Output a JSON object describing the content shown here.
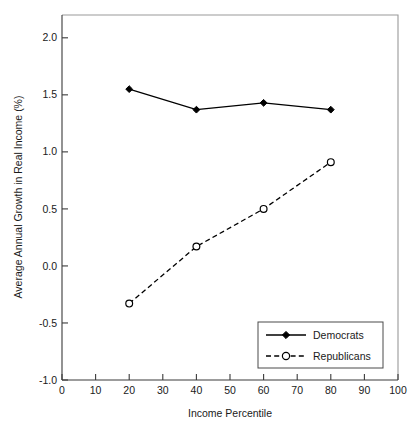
{
  "chart_data": {
    "type": "line",
    "title": "",
    "xlabel": "Income Percentile",
    "ylabel": "Average Annual Growth in Real Income (%)",
    "xlim": [
      0,
      100
    ],
    "ylim": [
      -1.0,
      2.2
    ],
    "grid": false,
    "legend_position": "lower right",
    "xticks": [
      0,
      10,
      20,
      30,
      40,
      50,
      60,
      70,
      80,
      90,
      100
    ],
    "xtick_labels": [
      "0",
      "10",
      "20",
      "30",
      "40",
      "50",
      "60",
      "70",
      "80",
      "90",
      "100"
    ],
    "yticks": [
      -1.0,
      -0.5,
      0.0,
      0.5,
      1.0,
      1.5,
      2.0
    ],
    "ytick_labels": [
      "-1.0",
      "-0.5",
      "0.0",
      "0.5",
      "1.0",
      "1.5",
      "2.0"
    ],
    "x": [
      20,
      40,
      60,
      80
    ],
    "series": [
      {
        "name": "Democrats",
        "values": [
          1.55,
          1.37,
          1.43,
          1.37
        ],
        "line_style": "solid",
        "marker": "filled-diamond",
        "color": "#000000"
      },
      {
        "name": "Republicans",
        "values": [
          -0.33,
          0.17,
          0.5,
          0.91
        ],
        "line_style": "dashed",
        "marker": "open-circle",
        "color": "#000000"
      }
    ]
  },
  "legend": {
    "entries": [
      {
        "label": "Democrats"
      },
      {
        "label": "Republicans"
      }
    ]
  }
}
